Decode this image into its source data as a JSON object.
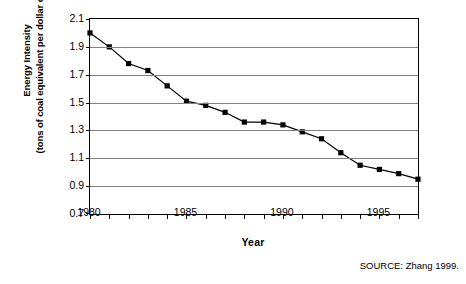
{
  "chart_data": {
    "type": "line",
    "title": "",
    "xlabel": "Year",
    "ylabel": "Energy Intensity (tons of coal equivalent per dollar of GDP)",
    "ylabel_line1": "Energy Intensity",
    "ylabel_line2": "(tons of coal equivalent per dollar of GDP)",
    "xlim": [
      1980,
      1997
    ],
    "ylim": [
      0.7,
      2.1
    ],
    "ytick_values": [
      2.1,
      1.9,
      1.7,
      1.5,
      1.3,
      1.1,
      0.9,
      0.7
    ],
    "ytick_labels": [
      "2.1",
      "1.9",
      "1.7",
      "1.5",
      "1.3",
      "1.1",
      "0.9",
      "0.7"
    ],
    "xtick_values": [
      1980,
      1981,
      1982,
      1983,
      1984,
      1985,
      1986,
      1987,
      1988,
      1989,
      1990,
      1991,
      1992,
      1993,
      1994,
      1995,
      1996,
      1997
    ],
    "xtick_labeled": [
      1980,
      1985,
      1990,
      1995
    ],
    "xtick_labels": [
      "1980",
      "1985",
      "1990",
      "1995"
    ],
    "grid": true,
    "grid_axis": "y",
    "legend": false,
    "marker": "square",
    "series": [
      {
        "name": "Energy Intensity",
        "x": [
          1980,
          1981,
          1982,
          1983,
          1984,
          1985,
          1986,
          1987,
          1988,
          1989,
          1990,
          1991,
          1992,
          1993,
          1994,
          1995,
          1996,
          1997
        ],
        "values": [
          2.0,
          1.9,
          1.78,
          1.73,
          1.62,
          1.51,
          1.48,
          1.43,
          1.36,
          1.36,
          1.34,
          1.29,
          1.24,
          1.14,
          1.05,
          1.02,
          0.99,
          0.95
        ]
      }
    ]
  },
  "source_note": "SOURCE: Zhang 1999."
}
